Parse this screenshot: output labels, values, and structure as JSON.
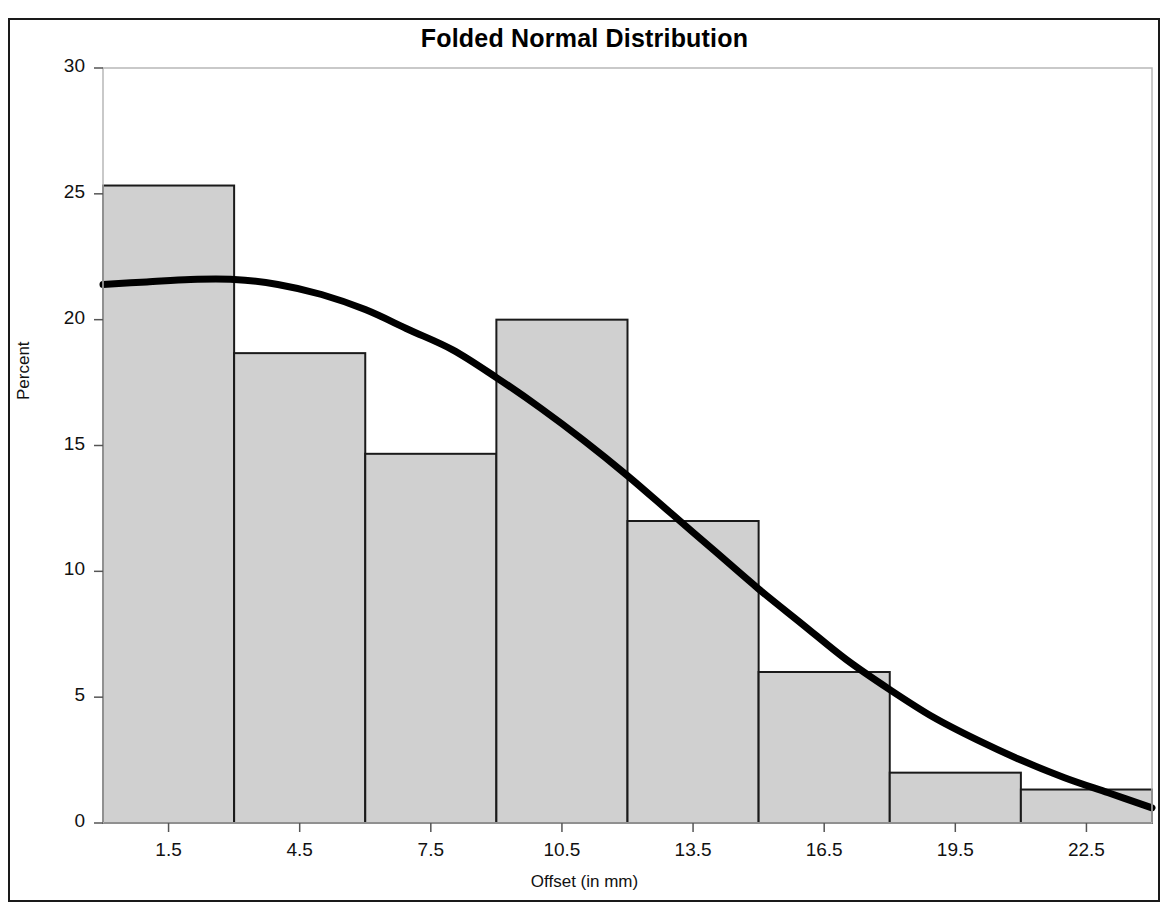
{
  "chart_data": {
    "type": "bar",
    "title": "Folded Normal Distribution",
    "xlabel": "Offset (in mm)",
    "ylabel": "Percent",
    "xlim": [
      0,
      24
    ],
    "ylim": [
      0,
      30
    ],
    "grid": false,
    "legend": null,
    "xticks": [
      "1.5",
      "4.5",
      "7.5",
      "10.5",
      "13.5",
      "16.5",
      "19.5",
      "22.5"
    ],
    "xtick_values": [
      1.5,
      4.5,
      7.5,
      10.5,
      13.5,
      16.5,
      19.5,
      22.5
    ],
    "yticks": [
      "0",
      "5",
      "10",
      "15",
      "20",
      "25",
      "30"
    ],
    "ytick_values": [
      0,
      5,
      10,
      15,
      20,
      25,
      30
    ],
    "bin_edges": [
      0,
      3,
      6,
      9,
      12,
      15,
      18,
      21,
      24
    ],
    "bin_midpoints": [
      1.5,
      4.5,
      7.5,
      10.5,
      13.5,
      16.5,
      19.5,
      22.5
    ],
    "values": [
      25.33,
      18.67,
      14.67,
      20.0,
      12.0,
      6.0,
      2.0,
      1.33
    ],
    "bar_fill_color": "#d0d0d0",
    "bar_edge_color": "#1a1a1a",
    "curve_color": "#000000",
    "curve_label": "Folded normal density overlay",
    "curve_points": [
      {
        "x": 0.0,
        "y": 21.4
      },
      {
        "x": 1.0,
        "y": 21.5
      },
      {
        "x": 2.0,
        "y": 21.6
      },
      {
        "x": 3.0,
        "y": 21.6
      },
      {
        "x": 4.0,
        "y": 21.4
      },
      {
        "x": 5.0,
        "y": 21.0
      },
      {
        "x": 6.0,
        "y": 20.4
      },
      {
        "x": 7.0,
        "y": 19.6
      },
      {
        "x": 8.0,
        "y": 18.8
      },
      {
        "x": 9.0,
        "y": 17.7
      },
      {
        "x": 10.0,
        "y": 16.5
      },
      {
        "x": 11.0,
        "y": 15.2
      },
      {
        "x": 12.0,
        "y": 13.8
      },
      {
        "x": 13.0,
        "y": 12.3
      },
      {
        "x": 14.0,
        "y": 10.8
      },
      {
        "x": 15.0,
        "y": 9.3
      },
      {
        "x": 16.0,
        "y": 7.9
      },
      {
        "x": 17.0,
        "y": 6.5
      },
      {
        "x": 18.0,
        "y": 5.3
      },
      {
        "x": 19.0,
        "y": 4.2
      },
      {
        "x": 20.0,
        "y": 3.3
      },
      {
        "x": 21.0,
        "y": 2.5
      },
      {
        "x": 22.0,
        "y": 1.8
      },
      {
        "x": 23.0,
        "y": 1.2
      },
      {
        "x": 24.0,
        "y": 0.6
      }
    ]
  }
}
